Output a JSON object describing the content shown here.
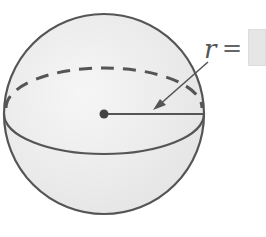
{
  "diagram": {
    "type": "sphere",
    "radius_label": "r",
    "equals_sign": "=",
    "answer_value": "",
    "colors": {
      "stroke": "#555555",
      "fill": "#ededed",
      "answer_box": "#e6e6e6"
    }
  }
}
